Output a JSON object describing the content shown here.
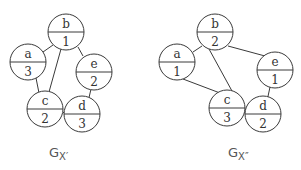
{
  "graphs": [
    {
      "caption": "G",
      "caption_sub": "X′",
      "nodes": [
        {
          "id": "b",
          "label": "b",
          "value": "1"
        },
        {
          "id": "a",
          "label": "a",
          "value": "3"
        },
        {
          "id": "e",
          "label": "e",
          "value": "2"
        },
        {
          "id": "c",
          "label": "c",
          "value": "2"
        },
        {
          "id": "d",
          "label": "d",
          "value": "3"
        }
      ],
      "edges": [
        [
          "a",
          "b"
        ],
        [
          "b",
          "c"
        ],
        [
          "b",
          "e"
        ],
        [
          "a",
          "c"
        ],
        [
          "c",
          "d"
        ],
        [
          "e",
          "d"
        ]
      ]
    },
    {
      "caption": "G",
      "caption_sub": "X″",
      "nodes": [
        {
          "id": "b",
          "label": "b",
          "value": "2"
        },
        {
          "id": "a",
          "label": "a",
          "value": "1"
        },
        {
          "id": "e",
          "label": "e",
          "value": "1"
        },
        {
          "id": "c",
          "label": "c",
          "value": "3"
        },
        {
          "id": "d",
          "label": "d",
          "value": "2"
        }
      ],
      "edges": [
        [
          "a",
          "b"
        ],
        [
          "b",
          "c"
        ],
        [
          "b",
          "e"
        ],
        [
          "a",
          "c"
        ],
        [
          "c",
          "d"
        ],
        [
          "e",
          "d"
        ]
      ]
    }
  ]
}
